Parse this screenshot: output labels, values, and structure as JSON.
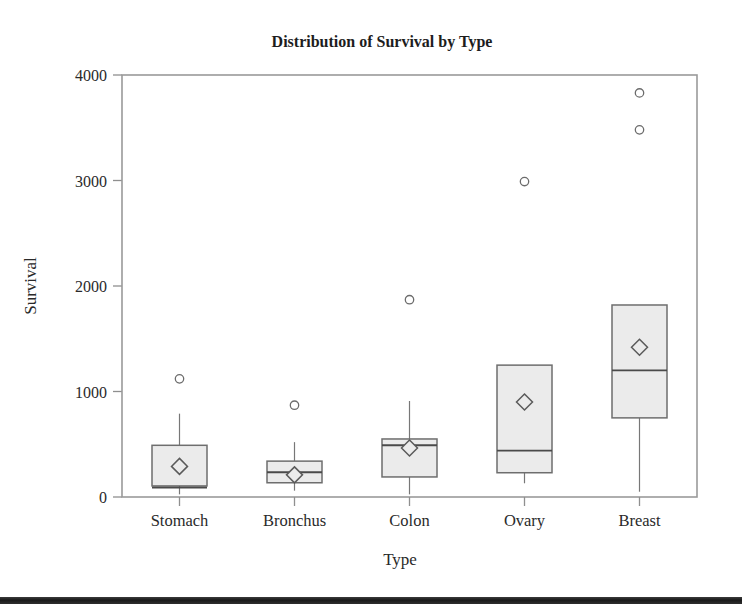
{
  "chart_data": {
    "type": "box",
    "title": "Distribution of Survival by Type",
    "xlabel": "Type",
    "ylabel": "Survival",
    "categories": [
      "Stomach",
      "Bronchus",
      "Colon",
      "Ovary",
      "Breast"
    ],
    "ylim": [
      0,
      4000
    ],
    "yticks": [
      0,
      1000,
      2000,
      3000,
      4000
    ],
    "ytick_labels": [
      "0",
      "1000",
      "2000",
      "3000",
      "4000"
    ],
    "grid": false,
    "legend": "none",
    "markers": {
      "mean": "diamond",
      "outlier": "open-circle"
    },
    "boxes": [
      {
        "category": "Stomach",
        "whisker_low": 25,
        "q1": 105,
        "median": 90,
        "q3": 490,
        "whisker_high": 790,
        "mean": 290,
        "outliers": [
          1120
        ]
      },
      {
        "category": "Bronchus",
        "whisker_low": 60,
        "q1": 135,
        "median": 235,
        "q3": 340,
        "whisker_high": 520,
        "mean": 210,
        "outliers": [
          870
        ]
      },
      {
        "category": "Colon",
        "whisker_low": 25,
        "q1": 190,
        "median": 490,
        "q3": 550,
        "whisker_high": 910,
        "mean": 465,
        "outliers": [
          1870
        ]
      },
      {
        "category": "Ovary",
        "whisker_low": 130,
        "q1": 230,
        "median": 440,
        "q3": 1250,
        "whisker_high": 1250,
        "mean": 900,
        "outliers": [
          2990
        ]
      },
      {
        "category": "Breast",
        "whisker_low": 50,
        "q1": 750,
        "median": 1200,
        "q3": 1820,
        "whisker_high": 1820,
        "mean": 1420,
        "outliers": [
          3480,
          3830
        ]
      }
    ],
    "colors": {
      "box_fill": "#ebebeb",
      "box_stroke": "#6e6e6e",
      "median": "#4a4a4a",
      "whisker": "#777777",
      "frame": "#9a9a9a",
      "text": "#2a2a2a"
    }
  }
}
